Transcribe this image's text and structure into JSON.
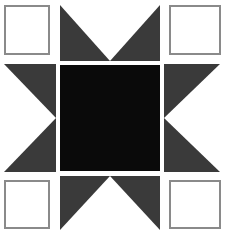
{
  "canvas": {
    "width": 226,
    "height": 235,
    "background_color": "#ffffff",
    "title": "Quilt Block Pattern"
  },
  "palette": {
    "white": "#ffffff",
    "dark_gray": "#3a3a3a",
    "black": "#0a0a0a",
    "border_gray": "#8a8a8a"
  },
  "pattern": {
    "grid_rows": 3,
    "grid_cols": 3,
    "cells": [
      {
        "id": "top-left",
        "row": 0,
        "col": 0,
        "kind": "square",
        "fill": "#ffffff",
        "border_color": "#8a8a8a",
        "label": "white-square"
      },
      {
        "id": "top-center",
        "row": 0,
        "col": 1,
        "kind": "triangle-panel",
        "panel_fill": "#3a3a3a",
        "triangle_fill": "#ffffff",
        "triangle_direction": "down",
        "label": "down-triangle"
      },
      {
        "id": "top-right",
        "row": 0,
        "col": 2,
        "kind": "square",
        "fill": "#ffffff",
        "border_color": "#8a8a8a",
        "label": "white-square"
      },
      {
        "id": "middle-left",
        "row": 1,
        "col": 0,
        "kind": "triangle-panel",
        "panel_fill": "#3a3a3a",
        "triangle_fill": "#ffffff",
        "triangle_direction": "right",
        "label": "right-triangle"
      },
      {
        "id": "center",
        "row": 1,
        "col": 1,
        "kind": "square",
        "fill": "#0a0a0a",
        "border_color": "#0a0a0a",
        "label": "black-square"
      },
      {
        "id": "middle-right",
        "row": 1,
        "col": 2,
        "kind": "triangle-panel",
        "panel_fill": "#3a3a3a",
        "triangle_fill": "#ffffff",
        "triangle_direction": "left",
        "label": "left-triangle"
      },
      {
        "id": "bottom-left",
        "row": 2,
        "col": 0,
        "kind": "square",
        "fill": "#ffffff",
        "border_color": "#8a8a8a",
        "label": "white-square"
      },
      {
        "id": "bottom-center",
        "row": 2,
        "col": 1,
        "kind": "triangle-panel",
        "panel_fill": "#3a3a3a",
        "triangle_fill": "#ffffff",
        "triangle_direction": "up",
        "label": "up-triangle"
      },
      {
        "id": "bottom-right",
        "row": 2,
        "col": 2,
        "kind": "square",
        "fill": "#ffffff",
        "border_color": "#8a8a8a",
        "label": "white-square"
      }
    ]
  }
}
